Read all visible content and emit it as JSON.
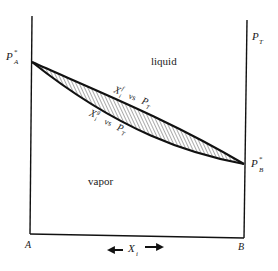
{
  "diagram": {
    "type": "phase-diagram",
    "title": "",
    "left_axis": {
      "label_main": "P",
      "label_sup": "*",
      "label_sub": "A",
      "bottom_label": "A"
    },
    "right_axis": {
      "top_label_main": "P",
      "top_label_sub": "T",
      "point_label_main": "P",
      "point_label_sup": "*",
      "point_label_sub": "B",
      "bottom_label": "B"
    },
    "x_axis": {
      "label_main": "X",
      "label_sub": "i",
      "arrows": "bidirectional"
    },
    "regions": {
      "upper": "liquid",
      "lower": "vapor"
    },
    "curves": [
      {
        "name": "bubble-point",
        "label_main": "X",
        "label_sub": "i",
        "label_sup": "f",
        "label_vs": "vs",
        "label_p": "P",
        "label_p_sub": "T"
      },
      {
        "name": "dew-point",
        "label_main": "X",
        "label_sub": "i",
        "label_sup": "g",
        "label_vs": "vs",
        "label_p": "P",
        "label_p_sub": "T"
      }
    ],
    "shaded_region": "two-phase (hatched)",
    "colors": {
      "ink": "#1a1a1a",
      "background": "#ffffff"
    }
  }
}
